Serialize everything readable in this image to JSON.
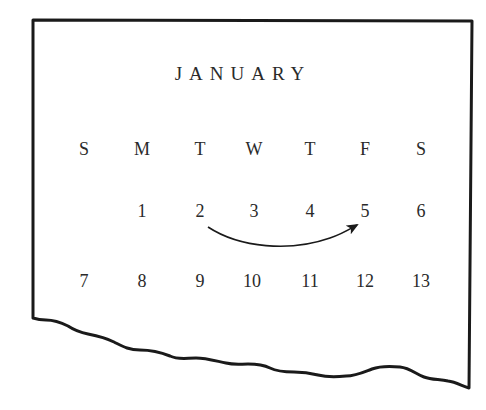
{
  "calendar": {
    "month": "JANUARY",
    "weekday_headers": [
      "S",
      "M",
      "T",
      "W",
      "T",
      "F",
      "S"
    ],
    "weeks": [
      [
        "",
        "1",
        "2",
        "3",
        "4",
        "5",
        "6"
      ],
      [
        "7",
        "8",
        "9",
        "10",
        "11",
        "12",
        "13"
      ]
    ],
    "arrow": {
      "from_day": "2",
      "to_day": "5",
      "description": "curved arrow from Tuesday 2 to Friday 5"
    },
    "page_edge": "torn bottom edge"
  },
  "colors": {
    "ink": "#1a1a1a",
    "text": "#2a2a2a",
    "paper": "#ffffff"
  }
}
